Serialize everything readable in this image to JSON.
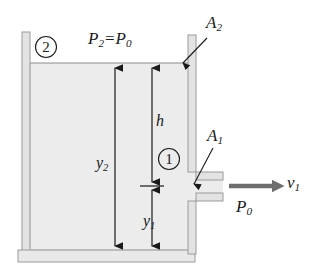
{
  "figure": {
    "colors": {
      "water_fill": "#ececec",
      "wall_fill": "#e3e3e3",
      "outline": "#8c8c8c",
      "ink": "#1a1a1a",
      "velocity_arrow": "#6e6e6e",
      "page_background": "#ffffff"
    },
    "labels": {
      "point_2_marker": "2",
      "point_1_marker": "1",
      "surface_pressure_P": "P",
      "surface_pressure_sub_left": "2",
      "surface_pressure_equals": "=",
      "surface_pressure_P_right": "P",
      "surface_pressure_sub_right": "0",
      "area_top_P": "A",
      "area_top_sub": "2",
      "area_spout_P": "A",
      "area_spout_sub": "1",
      "height_h": "h",
      "height_y2_P": "y",
      "height_y2_sub": "2",
      "height_y1_P": "y",
      "height_y1_sub": "1",
      "ambient_pressure_P": "P",
      "ambient_pressure_sub": "0",
      "velocity_v": "v",
      "velocity_sub": "1"
    },
    "geometry": {
      "water_surface_y": 63,
      "tank_bottom_y": 250,
      "spout_center_y": 186,
      "left_wall_x": 22,
      "right_wall_x": 188
    }
  }
}
